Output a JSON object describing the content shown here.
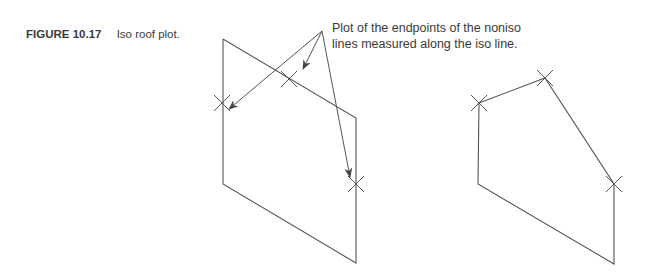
{
  "caption": {
    "label": "FIGURE 10.17",
    "title": "Iso roof plot."
  },
  "annotation": {
    "line1": "Plot of the endpoints of the noniso",
    "line2": "lines measured along the iso line."
  },
  "colors": {
    "line": "#555555",
    "text": "#3a3a3a",
    "background": "#ffffff"
  }
}
